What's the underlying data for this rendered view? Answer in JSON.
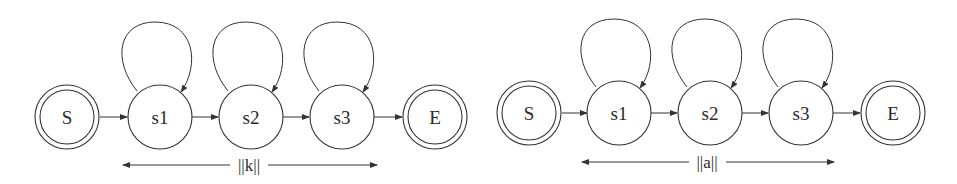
{
  "diagrams": [
    {
      "id": "left",
      "start": {
        "label": "S"
      },
      "states": [
        {
          "label": "s1"
        },
        {
          "label": "s2"
        },
        {
          "label": "s3"
        }
      ],
      "end": {
        "label": "E"
      },
      "span_label": "||k||",
      "self_loops": [
        "s1",
        "s2",
        "s3"
      ],
      "layout": {
        "cy": 117,
        "xs": [
          67,
          160,
          251,
          342,
          435
        ],
        "loop_top": 22,
        "span_y": 165,
        "span_x": [
          123,
          377
        ]
      }
    },
    {
      "id": "right",
      "start": {
        "label": "S"
      },
      "states": [
        {
          "label": "s1"
        },
        {
          "label": "s2"
        },
        {
          "label": "s3"
        }
      ],
      "end": {
        "label": "E"
      },
      "span_label": "||a||",
      "self_loops": [
        "s1",
        "s2",
        "s3"
      ],
      "layout": {
        "cy": 113,
        "xs": [
          529,
          619,
          710,
          801,
          893
        ],
        "loop_top": 19,
        "span_y": 162,
        "span_x": [
          582,
          834
        ]
      }
    }
  ],
  "colors": {
    "stroke": "#333333",
    "text": "#2a2a2a",
    "background": "#ffffff"
  }
}
